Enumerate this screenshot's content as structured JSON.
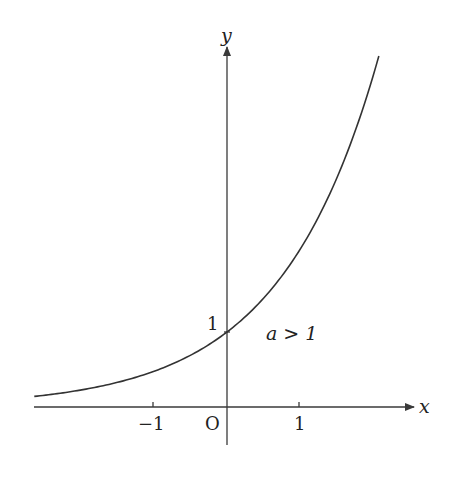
{
  "diagram": {
    "type": "function-graph",
    "function": "y = a^x",
    "condition_label": "a > 1",
    "axes": {
      "x_label": "x",
      "y_label": "y",
      "origin_label": "O",
      "x_ticks": [
        {
          "value": -1,
          "label": "−1"
        },
        {
          "value": 1,
          "label": "1"
        }
      ],
      "y_ticks": [
        {
          "value": 1,
          "label": "1"
        }
      ]
    },
    "curve": {
      "base": 2.1,
      "x_range": [
        -2.64,
        2.08
      ],
      "passes_through": [
        0,
        1
      ]
    },
    "colors": {
      "line": "#333333",
      "background": "#ffffff"
    }
  }
}
